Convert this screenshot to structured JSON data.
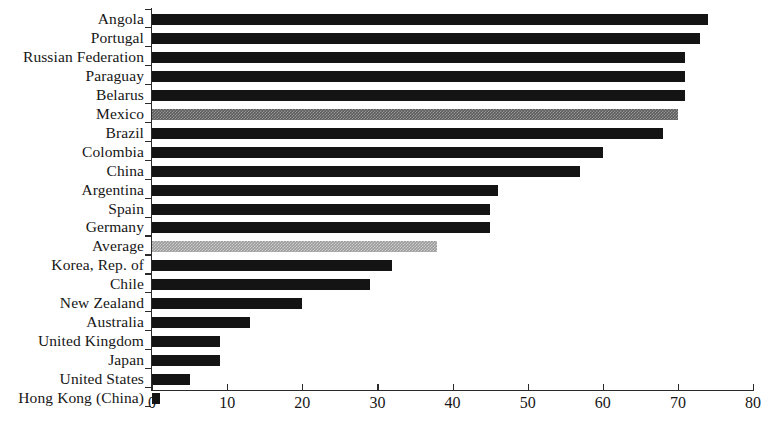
{
  "chart_data": {
    "type": "bar",
    "orientation": "horizontal",
    "title": "",
    "subtitle": "",
    "xlabel": "",
    "ylabel": "",
    "xlim": [
      0,
      80
    ],
    "ylim": null,
    "grid": false,
    "legend": null,
    "xticks": [
      0,
      10,
      20,
      30,
      40,
      50,
      60,
      70,
      80
    ],
    "xtick_labels": [
      "0",
      "10",
      "20",
      "30",
      "40",
      "50",
      "60",
      "70",
      "80"
    ],
    "categories": [
      "Angola",
      "Portugal",
      "Russian Federation",
      "Paraguay",
      "Belarus",
      "Mexico",
      "Brazil",
      "Colombia",
      "China",
      "Argentina",
      "Spain",
      "Germany",
      "Average",
      "Korea, Rep. of",
      "Chile",
      "New Zealand",
      "Australia",
      "United Kingdom",
      "Japan",
      "United States",
      "Hong Kong (China)"
    ],
    "values": [
      74,
      73,
      71,
      71,
      71,
      70,
      68,
      60,
      57,
      46,
      45,
      45,
      38,
      32,
      29,
      20,
      13,
      9,
      9,
      5,
      1
    ],
    "bar_styles": [
      "dark",
      "dark",
      "dark",
      "dark",
      "dark",
      "mid",
      "dark",
      "dark",
      "dark",
      "dark",
      "dark",
      "dark",
      "light",
      "dark",
      "dark",
      "dark",
      "dark",
      "dark",
      "dark",
      "dark",
      "dark"
    ],
    "colors": {
      "dark": "#141414",
      "mid": "#5d5d5d",
      "light": "#9b9b9b",
      "axis": "#2a2a2a",
      "background": "#ffffff",
      "text": "#161616"
    }
  }
}
